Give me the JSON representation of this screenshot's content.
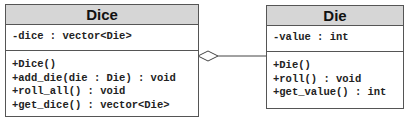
{
  "diagram": {
    "type": "UML class diagram",
    "classes": [
      {
        "name": "Dice",
        "attributes": [
          "-dice : vector<Die>"
        ],
        "methods": [
          "+Dice()",
          "+add_die(die : Die) : void",
          "+roll_all() : void",
          "+get_dice() : vector<Die>"
        ]
      },
      {
        "name": "Die",
        "attributes": [
          "-value : int"
        ],
        "methods": [
          "+Die()",
          "+roll() : void",
          "+get_value() : int"
        ]
      }
    ],
    "relationships": [
      {
        "type": "aggregation",
        "whole": "Dice",
        "part": "Die",
        "diamond": "hollow"
      }
    ]
  }
}
